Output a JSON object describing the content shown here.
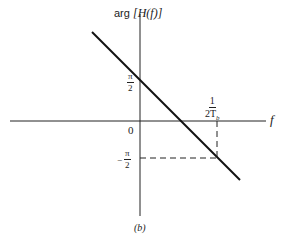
{
  "diagram": {
    "y_axis_label_prefix": "arg",
    "y_axis_label_expr": "[H(f)]",
    "x_axis_label": "f",
    "origin_label": "0",
    "tick_pos_num": "π",
    "tick_pos_den": "2",
    "tick_neg_sign": "−",
    "tick_neg_num": "π",
    "tick_neg_den": "2",
    "x_tick_num": "1",
    "x_tick_den": "2T",
    "x_tick_den_sub": "b",
    "caption": "(b)"
  }
}
